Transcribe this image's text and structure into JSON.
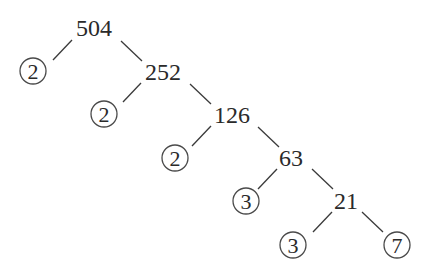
{
  "diagram": {
    "type": "factor-tree",
    "root": "504",
    "composites": [
      {
        "id": "n504",
        "label": "504",
        "x": 94,
        "y": 36
      },
      {
        "id": "n252",
        "label": "252",
        "x": 163,
        "y": 80
      },
      {
        "id": "n126",
        "label": "126",
        "x": 232,
        "y": 123
      },
      {
        "id": "n63",
        "label": "63",
        "x": 291,
        "y": 166
      },
      {
        "id": "n21",
        "label": "21",
        "x": 346,
        "y": 209
      }
    ],
    "primes": [
      {
        "id": "p1",
        "label": "2",
        "cx": 33,
        "cy": 71
      },
      {
        "id": "p2",
        "label": "2",
        "cx": 104,
        "cy": 114
      },
      {
        "id": "p3",
        "label": "2",
        "cx": 175,
        "cy": 158
      },
      {
        "id": "p4",
        "label": "3",
        "cx": 246,
        "cy": 201
      },
      {
        "id": "p5",
        "label": "3",
        "cx": 293,
        "cy": 245
      },
      {
        "id": "p6",
        "label": "7",
        "cx": 397,
        "cy": 245
      }
    ],
    "edges": [
      {
        "from": "504",
        "to": "2",
        "x1": 72,
        "y1": 40,
        "x2": 53,
        "y2": 60
      },
      {
        "from": "504",
        "to": "252",
        "x1": 121,
        "y1": 41,
        "x2": 142,
        "y2": 61
      },
      {
        "from": "252",
        "to": "2",
        "x1": 141,
        "y1": 83,
        "x2": 123,
        "y2": 102
      },
      {
        "from": "252",
        "to": "126",
        "x1": 190,
        "y1": 84,
        "x2": 211,
        "y2": 104
      },
      {
        "from": "126",
        "to": "2",
        "x1": 211,
        "y1": 126,
        "x2": 192,
        "y2": 146
      },
      {
        "from": "126",
        "to": "63",
        "x1": 258,
        "y1": 127,
        "x2": 279,
        "y2": 147
      },
      {
        "from": "63",
        "to": "3",
        "x1": 277,
        "y1": 169,
        "x2": 258,
        "y2": 189
      },
      {
        "from": "63",
        "to": "21",
        "x1": 312,
        "y1": 169,
        "x2": 333,
        "y2": 189
      },
      {
        "from": "21",
        "to": "3",
        "x1": 332,
        "y1": 212,
        "x2": 313,
        "y2": 232
      },
      {
        "from": "21",
        "to": "7",
        "x1": 362,
        "y1": 212,
        "x2": 383,
        "y2": 232
      }
    ],
    "prime_factorization": [
      "2",
      "2",
      "2",
      "3",
      "3",
      "7"
    ]
  }
}
